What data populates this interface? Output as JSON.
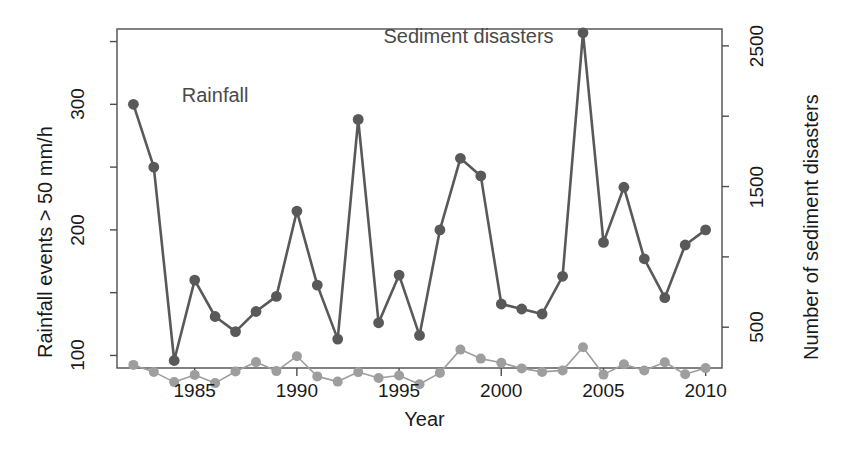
{
  "chart_data": {
    "type": "line",
    "title": "",
    "xlabel": "Year",
    "ylabel": "Rainfall events > 50 mm/h",
    "y2label": "Number of sediment disasters",
    "xlim": [
      1981.2,
      2010.8
    ],
    "ylim": [
      90,
      360
    ],
    "y2lim": [
      210,
      2620
    ],
    "grid": false,
    "legend_position": "inline-annotations",
    "x": [
      1982,
      1983,
      1984,
      1985,
      1986,
      1987,
      1988,
      1989,
      1990,
      1991,
      1992,
      1993,
      1994,
      1995,
      1996,
      1997,
      1998,
      1999,
      2000,
      2001,
      2002,
      2003,
      2004,
      2005,
      2006,
      2007,
      2008,
      2009,
      2010
    ],
    "xticks": [
      1985,
      1990,
      1995,
      2000,
      2005,
      2010
    ],
    "xticklabels": [
      "1985",
      "1990",
      "1995",
      "2000",
      "2005",
      "2010"
    ],
    "yticks": [
      100,
      150,
      200,
      250,
      300,
      350
    ],
    "yticklabels": [
      "100",
      "",
      "200",
      "",
      "300",
      ""
    ],
    "y2ticks": [
      500,
      1000,
      1500,
      2000,
      2500
    ],
    "y2ticklabels": [
      "500",
      "",
      "1500",
      "",
      "2500"
    ],
    "series": [
      {
        "name": "Rainfall",
        "axis": "left",
        "color": "#595959",
        "marker": "circle",
        "linewidth": 2.6,
        "annotation": "Rainfall",
        "values": [
          300,
          250,
          96,
          160,
          131,
          119,
          135,
          147,
          215,
          156,
          113,
          288,
          126,
          164,
          116,
          200,
          257,
          243,
          141,
          137,
          133,
          163,
          357,
          190,
          234,
          177,
          146,
          188,
          200
        ]
      },
      {
        "name": "Sediment disasters",
        "axis": "right",
        "color": "#9e9e9e",
        "marker": "circle",
        "linewidth": 1.6,
        "annotation": "Sediment disasters",
        "values": [
          232,
          182,
          110,
          161,
          103,
          185,
          252,
          188,
          294,
          150,
          113,
          181,
          139,
          157,
          94,
          175,
          341,
          277,
          248,
          207,
          182,
          193,
          357,
          163,
          237,
          192,
          251,
          165,
          209
        ]
      }
    ],
    "annotations": [
      {
        "text": "Rainfall",
        "x": 1986.0,
        "y": 305
      },
      {
        "text": "Sediment disasters",
        "x": 1998.4,
        "y": 352
      }
    ]
  }
}
